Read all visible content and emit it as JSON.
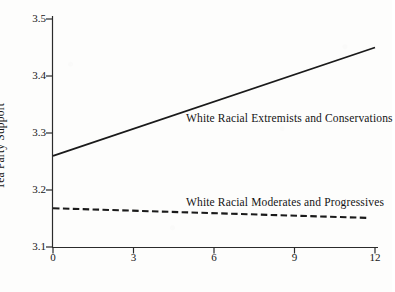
{
  "chart_data": {
    "type": "line",
    "title": "",
    "subtitle": "",
    "xlabel": "Negative Rhetoric Directed at Outgroups",
    "ylabel": "Tea Party Support",
    "xlim": [
      0,
      12
    ],
    "ylim": [
      3.1,
      3.5
    ],
    "xticks": [
      "0",
      "3",
      "6",
      "9",
      "12"
    ],
    "xtick_values": [
      0,
      3,
      6,
      9,
      12
    ],
    "yticks": [
      "3.1",
      "3.2",
      "3.3",
      "3.4",
      "3.5"
    ],
    "ytick_values": [
      3.1,
      3.2,
      3.3,
      3.4,
      3.5
    ],
    "grid": false,
    "legend_position": "inline-annotation",
    "x": [
      0,
      12
    ],
    "series": [
      {
        "name": "White Racial Extremists and Conservations",
        "label": "White Racial Extremists and Conservations",
        "style": "solid",
        "color": "#1a1a1a",
        "values": [
          3.26,
          3.45
        ],
        "x": [
          0,
          12
        ]
      },
      {
        "name": "White Racial Moderates and Progressives",
        "label": "White Racial Moderates and Progressives",
        "style": "dashed",
        "color": "#1a1a1a",
        "values": [
          3.168,
          3.151
        ],
        "x": [
          0,
          11.75
        ]
      }
    ],
    "annotations": [
      {
        "text": "White Racial Extremists and Conservations",
        "x": 8.3,
        "y": 3.335
      },
      {
        "text": "White Racial Moderates and Progressives",
        "x": 8.3,
        "y": 3.188
      }
    ]
  },
  "axis": {
    "line_color": "#2b2b2b",
    "spines": [
      "left",
      "bottom"
    ]
  }
}
